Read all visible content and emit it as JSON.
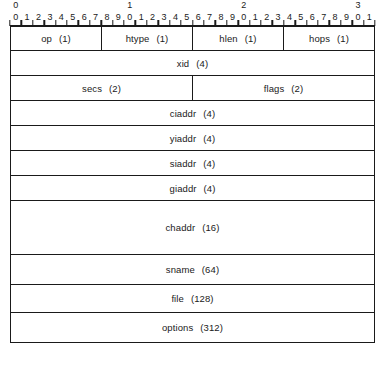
{
  "diagram": {
    "word_bits": 32,
    "ruler": {
      "decade_labels": [
        "0",
        "1",
        "2",
        "3"
      ],
      "decade_positions": [
        0,
        10,
        20,
        30
      ],
      "bit_labels": [
        "0",
        "1",
        "2",
        "3",
        "4",
        "5",
        "6",
        "7",
        "8",
        "9",
        "0",
        "1",
        "2",
        "3",
        "4",
        "5",
        "6",
        "7",
        "8",
        "9",
        "0",
        "1",
        "2",
        "3",
        "4",
        "5",
        "6",
        "7",
        "8",
        "9",
        "0",
        "1"
      ]
    },
    "rows": [
      {
        "id": "row-word0",
        "height_class": "h-quad",
        "fields": [
          {
            "name": "op",
            "size": "(1)",
            "bits": 8
          },
          {
            "name": "htype",
            "size": "(1)",
            "bits": 8
          },
          {
            "name": "hlen",
            "size": "(1)",
            "bits": 8
          },
          {
            "name": "hops",
            "size": "(1)",
            "bits": 8
          }
        ]
      },
      {
        "id": "row-xid",
        "height_class": "h-std",
        "fields": [
          {
            "name": "xid",
            "size": "(4)",
            "bits": 32
          }
        ]
      },
      {
        "id": "row-secs-flags",
        "height_class": "h-std",
        "fields": [
          {
            "name": "secs",
            "size": "(2)",
            "bits": 16
          },
          {
            "name": "flags",
            "size": "(2)",
            "bits": 16
          }
        ]
      },
      {
        "id": "row-ciaddr",
        "height_class": "h-std",
        "fields": [
          {
            "name": "ciaddr",
            "size": "(4)",
            "bits": 32
          }
        ]
      },
      {
        "id": "row-yiaddr",
        "height_class": "h-std",
        "fields": [
          {
            "name": "yiaddr",
            "size": "(4)",
            "bits": 32
          }
        ]
      },
      {
        "id": "row-siaddr",
        "height_class": "h-std",
        "fields": [
          {
            "name": "siaddr",
            "size": "(4)",
            "bits": 32
          }
        ]
      },
      {
        "id": "row-giaddr",
        "height_class": "h-std",
        "fields": [
          {
            "name": "giaddr",
            "size": "(4)",
            "bits": 32
          }
        ]
      },
      {
        "id": "row-chaddr",
        "height_class": "h-tall",
        "fields": [
          {
            "name": "chaddr",
            "size": "(16)",
            "bits": 32
          }
        ]
      },
      {
        "id": "row-sname",
        "height_class": "h-med",
        "fields": [
          {
            "name": "sname",
            "size": "(64)",
            "bits": 32
          }
        ]
      },
      {
        "id": "row-file",
        "height_class": "h-med2",
        "fields": [
          {
            "name": "file",
            "size": "(128)",
            "bits": 32
          }
        ]
      },
      {
        "id": "row-options",
        "height_class": "h-med",
        "fields": [
          {
            "name": "options",
            "size": "(312)",
            "bits": 32
          }
        ]
      }
    ]
  },
  "colors": {
    "line": "#1a1a1a",
    "background": "#ffffff",
    "text": "#1a1a1a"
  }
}
